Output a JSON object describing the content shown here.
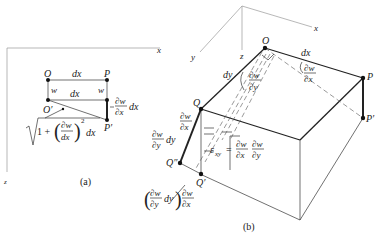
{
  "figure_a": {
    "caption": "(a)",
    "axes": {
      "x": "x",
      "z": "z"
    },
    "points": {
      "O": "O",
      "P": "P",
      "O_prime": "O′",
      "P_prime": "P′"
    },
    "labels": {
      "dx_top": "dx",
      "dx_mid": "dx",
      "w_left": "w",
      "w_right": "w",
      "dwdx_num": "∂w",
      "dwdx_den": "∂x",
      "dwdx_suffix": "dx",
      "sqrt_one_plus": "1 +",
      "sqrt_frac_num": "∂w",
      "sqrt_frac_den": "dx",
      "sqrt_exp": "2",
      "sqrt_suffix": "dx"
    }
  },
  "figure_b": {
    "caption": "(b)",
    "axes": {
      "x": "x",
      "y": "y",
      "z": "z"
    },
    "points": {
      "O": "O",
      "P": "P",
      "P_prime": "P′",
      "Q": "Q",
      "Q_prime": "Q′",
      "Q_dprime": "Q″"
    },
    "labels": {
      "dx": "dx",
      "dy": "dy",
      "slope_x_num": "∂w",
      "slope_x_den": "∂x",
      "slope_y_num": "∂w",
      "slope_y_den": "∂y",
      "q_slope_x_num": "∂w",
      "q_slope_x_den": "∂x",
      "q_dwdy_num": "∂w",
      "q_dwdy_den": "∂y",
      "q_dwdy_suffix": "dy",
      "exy_lhs": "ε",
      "exy_sub": "xy",
      "exy_eq": "=",
      "exy_f1_num": "∂w",
      "exy_f1_den": "∂x",
      "exy_f2_num": "∂w",
      "exy_f2_den": "∂y",
      "bottom_f1_num": "∂w",
      "bottom_f1_den": "∂y",
      "bottom_dy": "dy",
      "bottom_f2_num": "∂w",
      "bottom_f2_den": "∂x"
    }
  }
}
